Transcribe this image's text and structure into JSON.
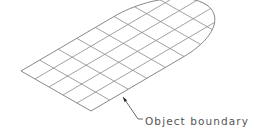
{
  "diagram": {
    "title": "",
    "type": "isometric surface mesh with boundary",
    "label": {
      "text": "Object boundary",
      "leader_from": [
        143,
        119
      ],
      "leader_elbow": [
        138,
        119
      ],
      "arrow_tip": [
        123,
        97
      ]
    },
    "colors": {
      "mesh_line": "#8a8a8a",
      "boundary_line": "#7a7a7a",
      "leader_line": "#444444",
      "label_text": "#555555",
      "background": "#ffffff"
    },
    "mesh": {
      "origin": [
        21,
        71
      ],
      "short_axis_cells": 5,
      "short_axis_step": [
        14,
        8
      ],
      "long_axis_step": [
        18.6,
        -10.9
      ],
      "straight_cells": 5,
      "arc_cells": 3
    },
    "boundary": {
      "left_corner": [
        21,
        71
      ],
      "bottom_corner": [
        91,
        111
      ],
      "straight_bottom_right_end": [
        184,
        57
      ],
      "straight_top_end": [
        114,
        16
      ],
      "arc_rightmost": [
        199,
        45
      ]
    }
  }
}
